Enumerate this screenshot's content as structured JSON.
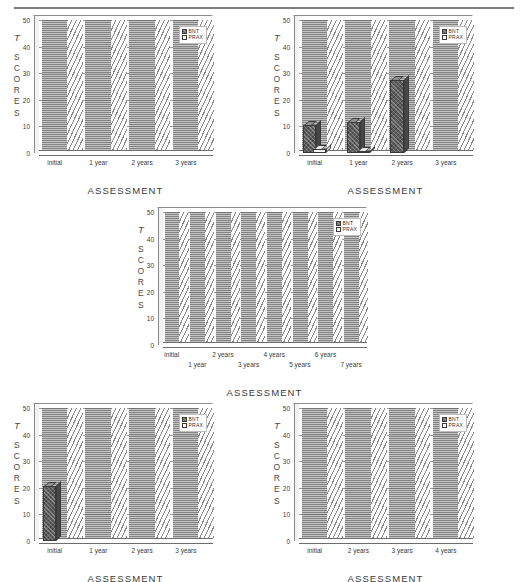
{
  "figure": {
    "panel_count": 5,
    "shared": {
      "ylabel_initial": "T",
      "ylabel_letters": [
        "S",
        "C",
        "O",
        "R",
        "E",
        "S"
      ],
      "xlabel": "ASSESSMENT",
      "yticks": [
        "0",
        "10",
        "20",
        "30",
        "40",
        "50"
      ],
      "legend": [
        {
          "name": "bnt-legend-entry",
          "label": "BNT",
          "swatch": "hatched-dark"
        },
        {
          "name": "prax-legend-entry",
          "label": "PRAX",
          "swatch": "white"
        }
      ],
      "colors": {
        "bnt_fill": "#5d5d5d",
        "prax_fill": "#ffffff",
        "axis": "#5a5a5a",
        "gridline": "#9b9b9b",
        "text": "#3a3a3a"
      }
    }
  },
  "chart_data": [
    {
      "id": "panel-1",
      "position": "top-left",
      "type": "bar",
      "title": "",
      "xlabel": "ASSESSMENT",
      "ylabel": "T SCORES",
      "ylim": [
        0,
        50
      ],
      "yticks": [
        0,
        10,
        20,
        30,
        40,
        50
      ],
      "grid": true,
      "legend_position": "top-right",
      "categories": [
        "initial",
        "1 year",
        "2 years",
        "3 years"
      ],
      "series": [
        {
          "name": "BNT",
          "values": [
            0,
            0,
            0,
            0
          ]
        },
        {
          "name": "PRAX",
          "values": [
            0,
            0,
            0,
            0
          ]
        }
      ]
    },
    {
      "id": "panel-2",
      "position": "top-right",
      "type": "bar",
      "title": "",
      "xlabel": "ASSESSMENT",
      "ylabel": "T SCORES",
      "ylim": [
        0,
        50
      ],
      "yticks": [
        0,
        10,
        20,
        30,
        40,
        50
      ],
      "grid": true,
      "legend_position": "top-right",
      "categories": [
        "initial",
        "1 year",
        "2 years",
        "3 years"
      ],
      "series": [
        {
          "name": "BNT",
          "values": [
            11,
            12,
            28,
            0
          ]
        },
        {
          "name": "PRAX",
          "values": [
            2,
            1,
            0,
            0
          ]
        }
      ]
    },
    {
      "id": "panel-3",
      "position": "middle-center",
      "type": "bar",
      "title": "",
      "xlabel": "ASSESSMENT",
      "ylabel": "T SCORES",
      "ylim": [
        0,
        50
      ],
      "yticks": [
        0,
        10,
        20,
        30,
        40,
        50
      ],
      "grid": true,
      "legend_position": "top-right",
      "categories": [
        "initial",
        "1 year",
        "2 years",
        "3 years",
        "4 years",
        "5 years",
        "6 years",
        "7 years"
      ],
      "series": [
        {
          "name": "BNT",
          "values": [
            0,
            0,
            0,
            0,
            0,
            0,
            0,
            0
          ]
        },
        {
          "name": "PRAX",
          "values": [
            0,
            0,
            0,
            0,
            0,
            0,
            0,
            0
          ]
        }
      ]
    },
    {
      "id": "panel-4",
      "position": "bottom-left",
      "type": "bar",
      "title": "",
      "xlabel": "ASSESSMENT",
      "ylabel": "T SCORES",
      "ylim": [
        0,
        50
      ],
      "yticks": [
        0,
        10,
        20,
        30,
        40,
        50
      ],
      "grid": true,
      "legend_position": "top-right",
      "categories": [
        "initial",
        "1 year",
        "2 years",
        "3 years"
      ],
      "series": [
        {
          "name": "BNT",
          "values": [
            21,
            0,
            0,
            0
          ]
        },
        {
          "name": "PRAX",
          "values": [
            0,
            0,
            0,
            0
          ]
        }
      ]
    },
    {
      "id": "panel-5",
      "position": "bottom-right",
      "type": "bar",
      "title": "",
      "xlabel": "ASSESSMENT",
      "ylabel": "T SCORES",
      "ylim": [
        0,
        50
      ],
      "yticks": [
        0,
        10,
        20,
        30,
        40,
        50
      ],
      "grid": true,
      "legend_position": "top-right",
      "categories": [
        "initial",
        "2 years",
        "3 years",
        "4 years"
      ],
      "series": [
        {
          "name": "BNT",
          "values": [
            0,
            0,
            0,
            0
          ]
        },
        {
          "name": "PRAX",
          "values": [
            0,
            0,
            0,
            0
          ]
        }
      ]
    }
  ]
}
